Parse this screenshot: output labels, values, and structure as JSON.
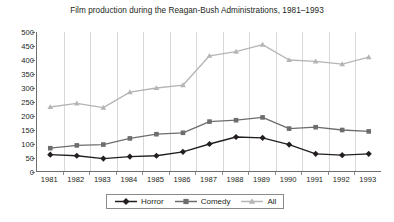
{
  "chart_data": {
    "type": "line",
    "title": "Film production during the Reagan-Bush Administrations, 1981–1993",
    "xlabel": "",
    "ylabel": "",
    "categories": [
      "1981",
      "1982",
      "1983",
      "1984",
      "1985",
      "1986",
      "1987",
      "1988",
      "1989",
      "1990",
      "1991",
      "1992",
      "1993"
    ],
    "x": [
      1981,
      1982,
      1983,
      1984,
      1985,
      1986,
      1987,
      1988,
      1989,
      1990,
      1991,
      1992,
      1993
    ],
    "ylim": [
      0,
      500
    ],
    "yticks": [
      0,
      50,
      100,
      150,
      200,
      250,
      300,
      350,
      400,
      450,
      500
    ],
    "grid": "vertical-only",
    "legend_position": "bottom-center",
    "series": [
      {
        "name": "Horror",
        "marker": "diamond",
        "color": "#231f20",
        "values": [
          62,
          58,
          48,
          55,
          58,
          72,
          100,
          125,
          122,
          98,
          65,
          60,
          65
        ]
      },
      {
        "name": "Comedy",
        "marker": "square",
        "color": "#6d6d6d",
        "values": [
          85,
          95,
          98,
          120,
          135,
          140,
          180,
          185,
          195,
          155,
          160,
          150,
          145
        ]
      },
      {
        "name": "All",
        "marker": "triangle",
        "color": "#b5b5b5",
        "values": [
          232,
          245,
          230,
          285,
          300,
          310,
          415,
          430,
          455,
          400,
          395,
          385,
          410
        ]
      }
    ]
  },
  "legend": {
    "entries": [
      {
        "label": "Horror"
      },
      {
        "label": "Comedy"
      },
      {
        "label": "All"
      }
    ]
  }
}
